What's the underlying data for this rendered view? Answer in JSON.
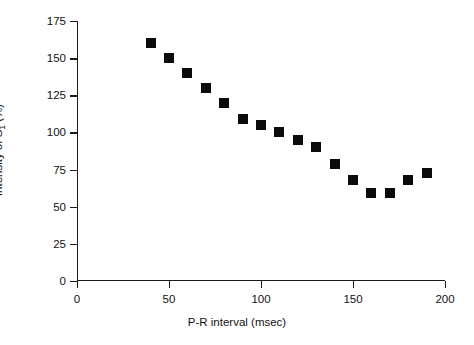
{
  "chart_data": {
    "type": "scatter",
    "title": "",
    "xlabel": "P-R interval (msec)",
    "ylabel_prefix": "Intensity of S",
    "ylabel_subscript": "1",
    "ylabel_suffix": " (%)",
    "ylabel_plain": "Intensity of S1 (%)",
    "xlim": [
      0,
      200
    ],
    "ylim": [
      0,
      175
    ],
    "xticks": [
      0,
      50,
      100,
      150,
      200
    ],
    "yticks": [
      0,
      25,
      50,
      75,
      100,
      125,
      150,
      175
    ],
    "xtick_labels": [
      "0",
      "50",
      "100",
      "150",
      "200"
    ],
    "ytick_labels": [
      "0",
      "25",
      "50",
      "75",
      "100",
      "125",
      "150",
      "175"
    ],
    "grid": false,
    "legend": "none",
    "marker": "filled-square",
    "marker_color": "#0b0b0b",
    "axis_color": "#1a1a1a",
    "x": [
      40,
      50,
      60,
      70,
      80,
      90,
      100,
      110,
      120,
      130,
      140,
      150,
      160,
      170,
      180,
      190
    ],
    "values": [
      160,
      150,
      140,
      130,
      120,
      109,
      105,
      100,
      95,
      90,
      79,
      68,
      59,
      59,
      68,
      73
    ],
    "points": [
      {
        "x": 40,
        "y": 160
      },
      {
        "x": 50,
        "y": 150
      },
      {
        "x": 60,
        "y": 140
      },
      {
        "x": 70,
        "y": 130
      },
      {
        "x": 80,
        "y": 120
      },
      {
        "x": 90,
        "y": 109
      },
      {
        "x": 100,
        "y": 105
      },
      {
        "x": 110,
        "y": 100
      },
      {
        "x": 120,
        "y": 95
      },
      {
        "x": 130,
        "y": 90
      },
      {
        "x": 140,
        "y": 79
      },
      {
        "x": 150,
        "y": 68
      },
      {
        "x": 160,
        "y": 59
      },
      {
        "x": 170,
        "y": 59
      },
      {
        "x": 180,
        "y": 68
      },
      {
        "x": 190,
        "y": 73
      }
    ]
  }
}
